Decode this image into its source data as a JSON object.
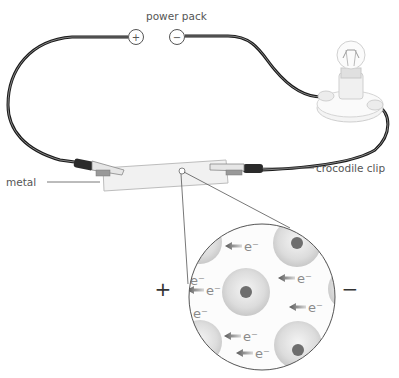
{
  "diagram": {
    "labels": {
      "power_pack": "power pack",
      "metal": "metal",
      "crocodile_clip": "crocodile clip"
    },
    "terminals": {
      "positive": "+",
      "negative": "−"
    },
    "magnified_view": {
      "left_sign": "+",
      "right_sign": "−",
      "electron_label": "e⁻",
      "electron_count": 10,
      "ion_count": 7
    },
    "colors": {
      "wire": "#1a1a1a",
      "ion_outer": "#d4d4d4",
      "ion_core": "#6e6e6e",
      "arrow": "#6a6a6a",
      "text": "#555555"
    }
  }
}
